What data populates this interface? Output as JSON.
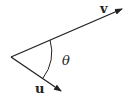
{
  "diagram": {
    "type": "vector-angle",
    "vectors": [
      {
        "name": "v",
        "label": "v",
        "bold": true
      },
      {
        "name": "u",
        "label": "u",
        "bold": true
      }
    ],
    "angle": {
      "label": "θ",
      "between": [
        "u",
        "v"
      ]
    },
    "colors": {
      "stroke": "#222222",
      "background": "#ffffff"
    }
  }
}
